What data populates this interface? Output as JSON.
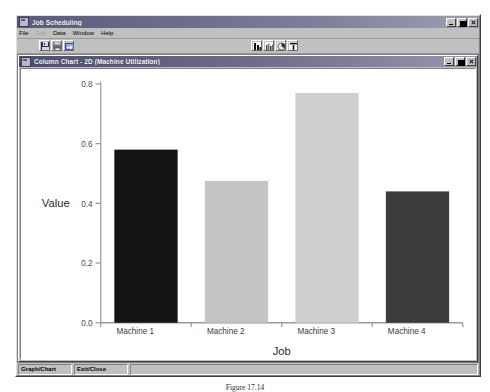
{
  "window": {
    "title": "Job Scheduling",
    "icon": "app-icon",
    "controls": [
      {
        "name": "minimize",
        "glyph": "minimize-icon"
      },
      {
        "name": "maximize",
        "glyph": "maximize-icon"
      },
      {
        "name": "close",
        "glyph": "close-icon"
      }
    ]
  },
  "menu": {
    "items": [
      {
        "label": "File",
        "disabled": false
      },
      {
        "label": "Edit",
        "disabled": true
      },
      {
        "label": "Data",
        "disabled": false
      },
      {
        "label": "Window",
        "disabled": false
      },
      {
        "label": "Help",
        "disabled": false
      }
    ]
  },
  "toolbar": {
    "left_buttons": [
      {
        "name": "save-button",
        "icon": "floppy-disk-icon"
      },
      {
        "name": "print-button",
        "icon": "printer-icon"
      },
      {
        "name": "export-button",
        "icon": "export-icon"
      }
    ],
    "chart_buttons": [
      {
        "name": "bar-chart-button",
        "icon": "bar-chart-icon"
      },
      {
        "name": "column-chart-button",
        "icon": "column-chart-icon"
      },
      {
        "name": "pie-chart-button",
        "icon": "pie-chart-icon"
      },
      {
        "name": "gantt-chart-button",
        "icon": "gantt-chart-icon"
      }
    ]
  },
  "chart_window": {
    "title": "Column Chart - 2D (Machine Utilization)",
    "icon": "chart-window-icon",
    "controls": [
      {
        "name": "minimize",
        "glyph": "minimize-icon"
      },
      {
        "name": "maximize",
        "glyph": "maximize-icon"
      },
      {
        "name": "close",
        "glyph": "close-icon"
      }
    ]
  },
  "statusbar": {
    "panes": [
      "Graph/Chart",
      "Exit/Close",
      ""
    ]
  },
  "caption": {
    "text": "Figure 17.14"
  },
  "chart_data": {
    "type": "bar",
    "title": "",
    "categories": [
      "Machine 1",
      "Machine 2",
      "Machine 3",
      "Machine 4"
    ],
    "values": [
      0.58,
      0.475,
      0.77,
      0.44
    ],
    "bar_colors": [
      "#141414",
      "#c4c4c4",
      "#cfcfcf",
      "#3b3b3b"
    ],
    "xlabel": "Job",
    "ylabel": "Value",
    "ylim": [
      0.0,
      0.8
    ],
    "yticks": [
      0.0,
      0.2,
      0.4,
      0.6,
      0.8
    ],
    "ytick_labels": [
      "0.0",
      "0.2",
      "0.4",
      "0.6",
      "0.8"
    ],
    "grid": false,
    "legend": "none"
  }
}
